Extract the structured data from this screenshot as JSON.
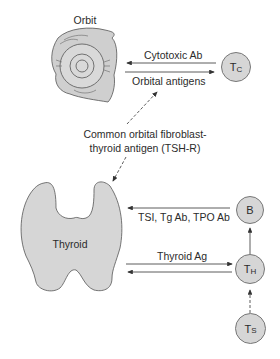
{
  "diagram": {
    "organs": {
      "orbit": {
        "label": "Orbit"
      },
      "thyroid": {
        "label": "Thyroid"
      }
    },
    "cells": {
      "tc": {
        "main": "T",
        "sub": "C"
      },
      "b": {
        "main": "B"
      },
      "th": {
        "main": "T",
        "sub": "H"
      },
      "ts": {
        "main": "T",
        "sub": "S"
      }
    },
    "arrows": {
      "cytotoxic_ab": "Cytotoxic Ab",
      "orbital_antigens": "Orbital antigens",
      "antibodies": "TSI, Tg Ab, TPO Ab",
      "thyroid_ag": "Thyroid Ag"
    },
    "common_antigen": {
      "line1": "Common orbital fibroblast-",
      "line2": "thyroid antigen (TSH-R)"
    },
    "colors": {
      "fill": "#d6d6d6",
      "stroke": "#555555",
      "line": "#333333"
    }
  }
}
